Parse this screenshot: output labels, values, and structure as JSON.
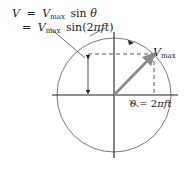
{
  "equation": {
    "line1": {
      "lhs": "V",
      "eq": "=",
      "var": "V",
      "sub": "max",
      "fn": "sin",
      "arg": "θ"
    },
    "line2": {
      "eq": "=",
      "var": "V",
      "sub": "max",
      "fn": "sin(2",
      "pi": "π",
      "ft": "ft",
      "close": ")"
    }
  },
  "labels": {
    "vector": {
      "var": "V",
      "sub": "max"
    },
    "angle": {
      "theta": "θ",
      "eq": " = 2",
      "pi": "π",
      "ft": "ft"
    }
  },
  "colors": {
    "vector": "#8a8a8a",
    "lines": "#222222",
    "circle": "#555555"
  }
}
